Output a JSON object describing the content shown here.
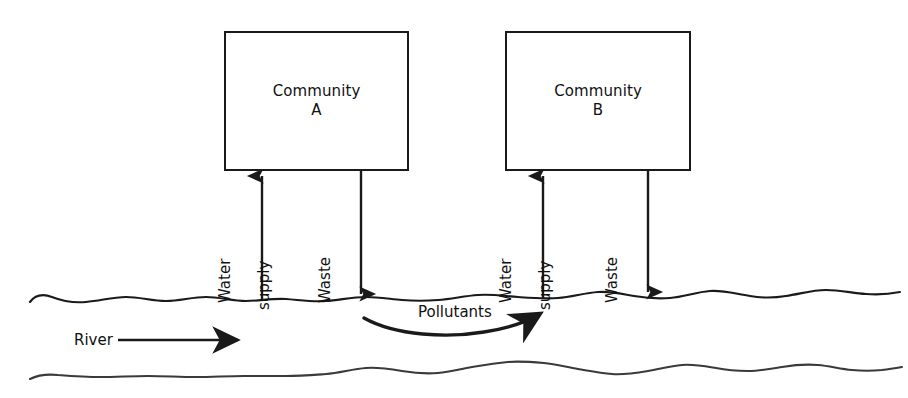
{
  "diagram": {
    "ink_color": "#1a1a1a",
    "background_color": "#ffffff",
    "communities": [
      {
        "id": "a",
        "title": "Community",
        "ident": "A"
      },
      {
        "id": "b",
        "title": "Community",
        "ident": "B"
      }
    ],
    "pipes": [
      {
        "id": "a-water-supply",
        "label_line1": "Water",
        "label_line2": "supply",
        "direction": "up"
      },
      {
        "id": "a-waste",
        "label_line1": "Waste",
        "direction": "down"
      },
      {
        "id": "b-water-supply",
        "label_line1": "Water",
        "label_line2": "supply",
        "direction": "up"
      },
      {
        "id": "b-waste",
        "label_line1": "Waste",
        "direction": "down"
      }
    ],
    "river": {
      "label": "River",
      "flow_direction": "right"
    },
    "pollutants": {
      "label": "Pollutants",
      "flow_direction": "right"
    }
  }
}
